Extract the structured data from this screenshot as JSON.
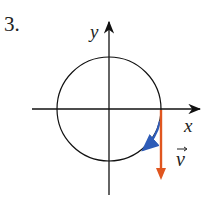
{
  "problem_number": "3.",
  "diagram": {
    "axes": {
      "x_label": "x",
      "y_label": "y"
    },
    "circle": {
      "center": [
        109,
        109
      ],
      "radius": 52
    },
    "velocity_vector": {
      "label": "v",
      "color": "#e0561f",
      "direction": "down"
    },
    "motion_arc": {
      "color": "#2e5cb8",
      "direction": "clockwise"
    }
  }
}
